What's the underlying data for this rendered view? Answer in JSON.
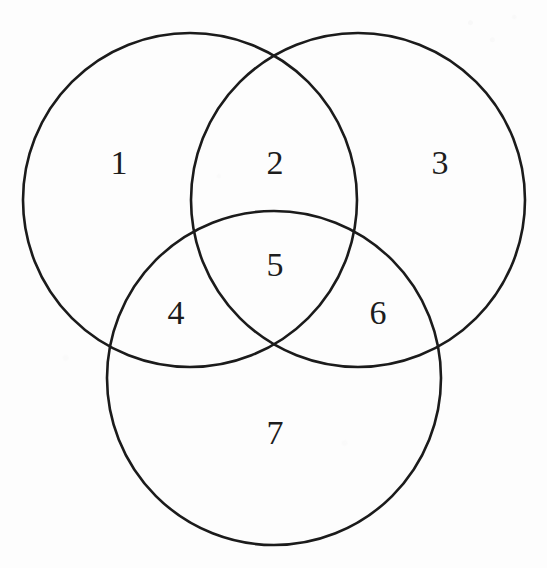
{
  "figure": {
    "kind": "venn-diagram",
    "sets": 3,
    "background_color": "#fdfdfd",
    "stroke_color": "#1b1b1b",
    "text_color": "#1d1d1d",
    "canvas": {
      "width": 547,
      "height": 568
    }
  },
  "circles": [
    {
      "name": "left-set-circle",
      "cx": 190,
      "cy": 200,
      "r": 167
    },
    {
      "name": "right-set-circle",
      "cx": 358,
      "cy": 200,
      "r": 167
    },
    {
      "name": "bottom-set-circle",
      "cx": 274,
      "cy": 378,
      "r": 167
    }
  ],
  "regions": [
    {
      "id": "region-1",
      "label": "1",
      "x": 119,
      "y": 163,
      "description": "left only"
    },
    {
      "id": "region-2",
      "label": "2",
      "x": 275,
      "y": 163,
      "description": "left and right"
    },
    {
      "id": "region-3",
      "label": "3",
      "x": 440,
      "y": 163,
      "description": "right only"
    },
    {
      "id": "region-4",
      "label": "4",
      "x": 176,
      "y": 313,
      "description": "left and bottom"
    },
    {
      "id": "region-5",
      "label": "5",
      "x": 275,
      "y": 265,
      "description": "left, right and bottom"
    },
    {
      "id": "region-6",
      "label": "6",
      "x": 378,
      "y": 313,
      "description": "right and bottom"
    },
    {
      "id": "region-7",
      "label": "7",
      "x": 275,
      "y": 433,
      "description": "bottom only"
    }
  ],
  "chart_data": {
    "type": "venn",
    "title": "",
    "set_count": 3,
    "region_labels": [
      "1",
      "2",
      "3",
      "4",
      "5",
      "6",
      "7"
    ],
    "regions": {
      "left_only": "1",
      "left_and_right": "2",
      "right_only": "3",
      "left_and_bottom": "4",
      "all_three": "5",
      "right_and_bottom": "6",
      "bottom_only": "7"
    },
    "legend": "none",
    "grid": false,
    "axes": false
  }
}
